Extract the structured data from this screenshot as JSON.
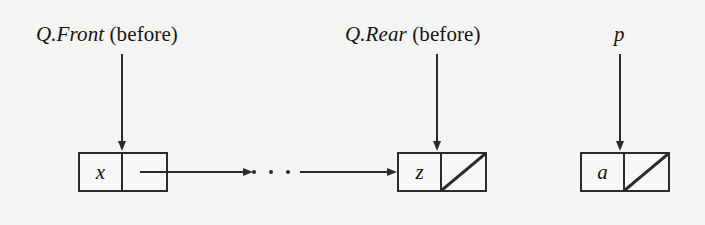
{
  "figure": {
    "background_color": "#f4f4f2",
    "ink_color": "#2a2a2a"
  },
  "labels": [
    {
      "id": "q-front-before",
      "math": "Q.Front",
      "paren": " (before)",
      "full_text": "Q.Front (before)"
    },
    {
      "id": "q-rear-before",
      "math": "Q.Rear",
      "paren": " (before)",
      "full_text": "Q.Rear (before)"
    },
    {
      "id": "p-pointer",
      "math": "p",
      "paren": "",
      "full_text": "p"
    }
  ],
  "nodes": [
    {
      "id": "node-x",
      "data": "x",
      "next": "link",
      "null_link": false
    },
    {
      "id": "node-z",
      "data": "z",
      "next": "null",
      "null_link": true
    },
    {
      "id": "node-a",
      "data": "a",
      "next": "null",
      "null_link": true
    }
  ],
  "connectors": {
    "ellipsis": "· · ·",
    "dot_count": 3,
    "arrow_from_x_label": "link from node x",
    "arrow_to_z_label": "link into node z"
  }
}
